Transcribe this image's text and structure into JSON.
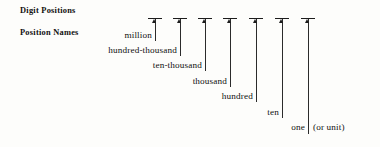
{
  "figure": {
    "background_color": "#fdfdfb",
    "ink_color": "#1c1c1c"
  },
  "row_labels": {
    "digit_positions": "Digit Positions",
    "position_names": "Position Names"
  },
  "unit_note": "(or unit)",
  "positions": [
    {
      "name": "million",
      "tick_x": 155,
      "label_x": 152,
      "label_y": 30,
      "line_top": 18,
      "line_bottom": 40
    },
    {
      "name": "hundred-thousand",
      "tick_x": 180,
      "label_x": 177,
      "label_y": 45,
      "line_top": 18,
      "line_bottom": 55
    },
    {
      "name": "ten-thousand",
      "tick_x": 205,
      "label_x": 202,
      "label_y": 60,
      "line_top": 18,
      "line_bottom": 70
    },
    {
      "name": "thousand",
      "tick_x": 230,
      "label_x": 227,
      "label_y": 76,
      "line_top": 18,
      "line_bottom": 86
    },
    {
      "name": "hundred",
      "tick_x": 256,
      "label_x": 253,
      "label_y": 91,
      "line_top": 18,
      "line_bottom": 101
    },
    {
      "name": "ten",
      "tick_x": 282,
      "label_x": 279,
      "label_y": 107,
      "line_top": 18,
      "line_bottom": 117
    },
    {
      "name": "one",
      "tick_x": 308,
      "label_x": 305,
      "label_y": 122,
      "line_top": 18,
      "line_bottom": 133
    }
  ]
}
